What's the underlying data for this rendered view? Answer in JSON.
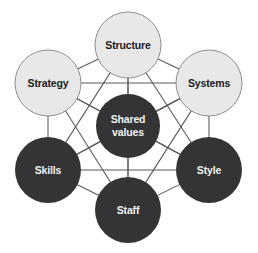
{
  "diagram": {
    "type": "network-hexagon",
    "width": 258,
    "height": 253,
    "background_color": "#ffffff",
    "line_color": "#58585a",
    "nodes": [
      {
        "id": "structure",
        "label": "Structure",
        "lines": [
          "Structure"
        ],
        "cx": 128,
        "cy": 45,
        "r": 33,
        "style": "light",
        "fill": "#e8e8e8",
        "stroke": "#8d8d8f",
        "text_color": "#1b1b1d",
        "font_size": 10.5
      },
      {
        "id": "strategy",
        "label": "Strategy",
        "lines": [
          "Strategy"
        ],
        "cx": 48,
        "cy": 83,
        "r": 33,
        "style": "light",
        "fill": "#e8e8e8",
        "stroke": "#8d8d8f",
        "text_color": "#1b1b1d",
        "font_size": 10.5
      },
      {
        "id": "systems",
        "label": "Systems",
        "lines": [
          "Systems"
        ],
        "cx": 209,
        "cy": 83,
        "r": 33,
        "style": "light",
        "fill": "#e8e8e8",
        "stroke": "#8d8d8f",
        "text_color": "#1b1b1d",
        "font_size": 10.5
      },
      {
        "id": "shared-values",
        "label": "Shared values",
        "lines": [
          "Shared",
          "values"
        ],
        "cx": 128,
        "cy": 126,
        "r": 32,
        "style": "dark",
        "fill": "#343436",
        "stroke": "none",
        "text_color": "#f2f2f2",
        "font_size": 10.5
      },
      {
        "id": "skills",
        "label": "Skills",
        "lines": [
          "Skills"
        ],
        "cx": 48,
        "cy": 170,
        "r": 33,
        "style": "dark",
        "fill": "#343436",
        "stroke": "none",
        "text_color": "#f2f2f2",
        "font_size": 10.5
      },
      {
        "id": "style",
        "label": "Style",
        "lines": [
          "Style"
        ],
        "cx": 209,
        "cy": 170,
        "r": 33,
        "style": "dark",
        "fill": "#343436",
        "stroke": "none",
        "text_color": "#f2f2f2",
        "font_size": 10.5
      },
      {
        "id": "staff",
        "label": "Staff",
        "lines": [
          "Staff"
        ],
        "cx": 128,
        "cy": 210,
        "r": 33,
        "style": "dark",
        "fill": "#343436",
        "stroke": "none",
        "text_color": "#f2f2f2",
        "font_size": 10.5
      }
    ],
    "edges": [
      {
        "from": "structure",
        "to": "strategy"
      },
      {
        "from": "structure",
        "to": "systems"
      },
      {
        "from": "structure",
        "to": "shared-values"
      },
      {
        "from": "structure",
        "to": "skills"
      },
      {
        "from": "structure",
        "to": "style"
      },
      {
        "from": "structure",
        "to": "staff"
      },
      {
        "from": "strategy",
        "to": "systems"
      },
      {
        "from": "strategy",
        "to": "shared-values"
      },
      {
        "from": "strategy",
        "to": "skills"
      },
      {
        "from": "strategy",
        "to": "style"
      },
      {
        "from": "strategy",
        "to": "staff"
      },
      {
        "from": "systems",
        "to": "shared-values"
      },
      {
        "from": "systems",
        "to": "skills"
      },
      {
        "from": "systems",
        "to": "style"
      },
      {
        "from": "systems",
        "to": "staff"
      },
      {
        "from": "shared-values",
        "to": "skills"
      },
      {
        "from": "shared-values",
        "to": "style"
      },
      {
        "from": "shared-values",
        "to": "staff"
      },
      {
        "from": "skills",
        "to": "style"
      },
      {
        "from": "skills",
        "to": "staff"
      },
      {
        "from": "style",
        "to": "staff"
      }
    ]
  }
}
